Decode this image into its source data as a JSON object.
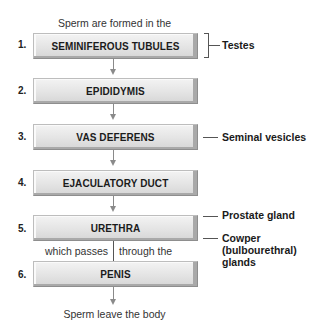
{
  "diagram": {
    "top_caption": "Sperm are formed in the",
    "bottom_caption": "Sperm leave the body",
    "mid_caption_left": "which passes",
    "mid_caption_right": "through the",
    "steps": [
      {
        "number": "1.",
        "label": "SEMINIFEROUS TUBULES"
      },
      {
        "number": "2.",
        "label": "EPIDIDYMIS"
      },
      {
        "number": "3.",
        "label": "VAS DEFERENS"
      },
      {
        "number": "4.",
        "label": "EJACULATORY DUCT"
      },
      {
        "number": "5.",
        "label": "URETHRA"
      },
      {
        "number": "6.",
        "label": "PENIS"
      }
    ],
    "side_labels": {
      "testes": "Testes",
      "seminal_vesicles": "Seminal vesicles",
      "prostate_gland": "Prostate gland",
      "cowper_line1": "Cowper",
      "cowper_line2": "(bulbourethral)",
      "cowper_line3": "glands"
    },
    "colors": {
      "box_fill": "#e4e4e4",
      "box_shadow": "#8e8e8e",
      "connector": "#8a8a8a",
      "text": "#1a1a1a"
    }
  }
}
